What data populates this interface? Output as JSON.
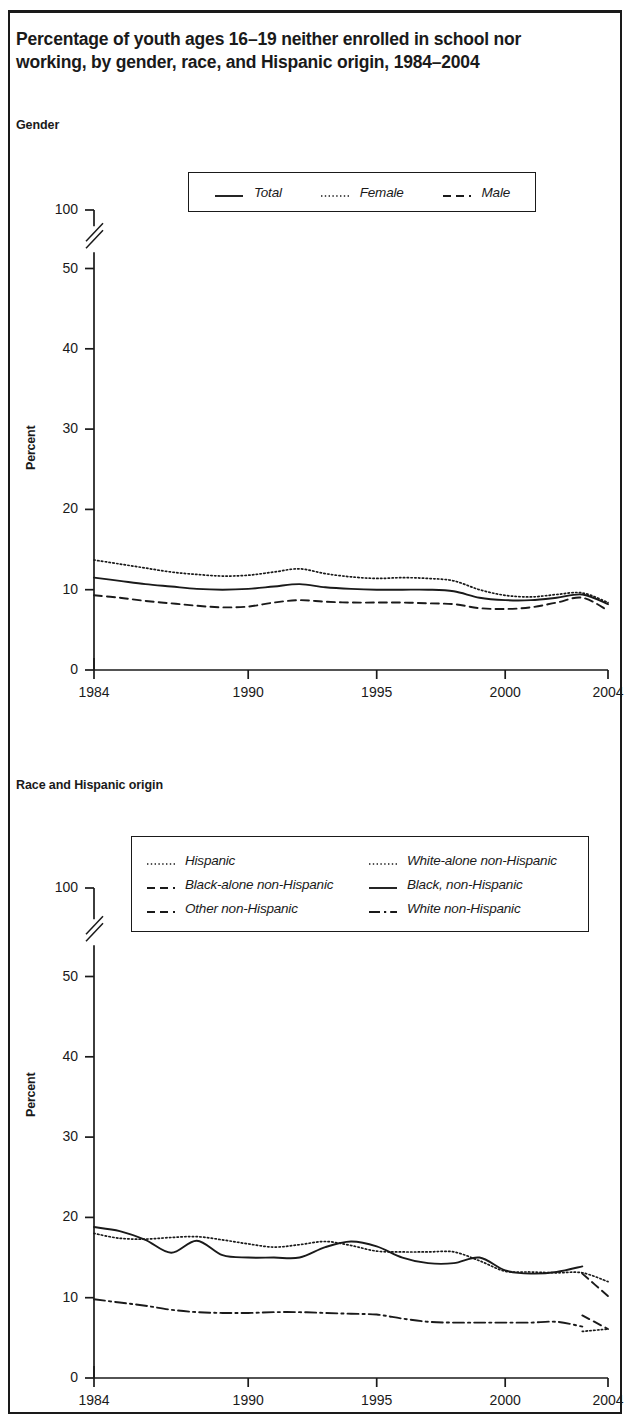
{
  "title": "Percentage of youth ages 16–19 neither enrolled in school nor working, by gender, race, and Hispanic origin, 1984–2004",
  "panels": {
    "gender": {
      "subhead": "Gender",
      "ylabel": "Percent"
    },
    "race": {
      "subhead": "Race and Hispanic origin",
      "ylabel": "Percent"
    }
  },
  "colors": {
    "ink": "#1a1a1a",
    "grid": "#1a1a1a",
    "background": "#ffffff"
  },
  "chart_data": [
    {
      "type": "line",
      "id": "gender",
      "title": "Gender",
      "xlabel": "",
      "ylabel": "Percent",
      "grid": false,
      "legend_position": "top-center",
      "axis_break": true,
      "axis_break_between": [
        50,
        100
      ],
      "xlim": [
        1984,
        2004
      ],
      "ylim": [
        0,
        100
      ],
      "ytick_labels": [
        "0",
        "10",
        "20",
        "30",
        "40",
        "50",
        "100"
      ],
      "yticks": [
        0,
        10,
        20,
        30,
        40,
        50,
        100
      ],
      "xtick_labels": [
        "1984",
        "1990",
        "1995",
        "2000",
        "2004"
      ],
      "xticks": [
        1984,
        1990,
        1995,
        2000,
        2004
      ],
      "x": [
        1984,
        1985,
        1986,
        1987,
        1988,
        1989,
        1990,
        1991,
        1992,
        1993,
        1994,
        1995,
        1996,
        1997,
        1998,
        1999,
        2000,
        2001,
        2002,
        2003,
        2004
      ],
      "series": [
        {
          "name": "Total",
          "style": "solid",
          "values": [
            11.5,
            11.1,
            10.7,
            10.4,
            10.1,
            10.0,
            10.1,
            10.4,
            10.7,
            10.3,
            10.1,
            10.0,
            10.0,
            10.0,
            9.8,
            9.0,
            8.7,
            8.7,
            9.0,
            9.4,
            8.2
          ]
        },
        {
          "name": "Female",
          "style": "dotted",
          "values": [
            13.7,
            13.2,
            12.7,
            12.2,
            11.9,
            11.7,
            11.8,
            12.2,
            12.6,
            12.0,
            11.6,
            11.4,
            11.5,
            11.4,
            11.1,
            10.0,
            9.3,
            9.1,
            9.4,
            9.6,
            8.4
          ]
        },
        {
          "name": "Male",
          "style": "dashed",
          "values": [
            9.3,
            9.0,
            8.6,
            8.3,
            8.0,
            7.8,
            7.9,
            8.4,
            8.7,
            8.5,
            8.4,
            8.4,
            8.4,
            8.3,
            8.2,
            7.7,
            7.6,
            7.8,
            8.4,
            9.0,
            7.4
          ]
        }
      ]
    },
    {
      "type": "line",
      "id": "race",
      "title": "Race and Hispanic origin",
      "xlabel": "",
      "ylabel": "Percent",
      "grid": false,
      "legend_position": "top-center",
      "axis_break": true,
      "axis_break_between": [
        50,
        100
      ],
      "xlim": [
        1984,
        2004
      ],
      "ylim": [
        0,
        100
      ],
      "ytick_labels": [
        "0",
        "10",
        "20",
        "30",
        "40",
        "50",
        "100"
      ],
      "yticks": [
        0,
        10,
        20,
        30,
        40,
        50,
        100
      ],
      "xtick_labels": [
        "1984",
        "1990",
        "1995",
        "2000",
        "2004"
      ],
      "xticks": [
        1984,
        1990,
        1995,
        2000,
        2004
      ],
      "x": [
        1984,
        1985,
        1986,
        1987,
        1988,
        1989,
        1990,
        1991,
        1992,
        1993,
        1994,
        1995,
        1996,
        1997,
        1998,
        1999,
        2000,
        2001,
        2002,
        2003,
        2004
      ],
      "series": [
        {
          "name": "Black, non-Hispanic",
          "style": "solid",
          "x": [
            1984,
            1985,
            1986,
            1987,
            1988,
            1989,
            1990,
            1991,
            1992,
            1993,
            1994,
            1995,
            1996,
            1997,
            1998,
            1999,
            2000,
            2001,
            2002,
            2003
          ],
          "values": [
            18.8,
            18.3,
            17.2,
            15.6,
            17.1,
            15.3,
            15.0,
            15.0,
            15.0,
            16.3,
            17.0,
            16.4,
            15.0,
            14.3,
            14.3,
            15.0,
            13.4,
            13.0,
            13.2,
            13.9
          ]
        },
        {
          "name": "Hispanic",
          "style": "dotted",
          "x": [
            1984,
            1985,
            1986,
            1987,
            1988,
            1989,
            1990,
            1991,
            1992,
            1993,
            1994,
            1995,
            1996,
            1997,
            1998,
            1999,
            2000,
            2001,
            2002,
            2003,
            2004
          ],
          "values": [
            18.0,
            17.4,
            17.3,
            17.5,
            17.6,
            17.2,
            16.7,
            16.3,
            16.6,
            17.0,
            16.5,
            15.8,
            15.7,
            15.7,
            15.7,
            14.6,
            13.3,
            13.2,
            13.1,
            13.1,
            12.0
          ]
        },
        {
          "name": "White non-Hispanic",
          "style": "dashdot",
          "x": [
            1984,
            1985,
            1986,
            1987,
            1988,
            1989,
            1990,
            1991,
            1992,
            1993,
            1994,
            1995,
            1996,
            1997,
            1998,
            1999,
            2000,
            2001,
            2002,
            2003
          ],
          "values": [
            9.8,
            9.4,
            9.0,
            8.5,
            8.2,
            8.1,
            8.1,
            8.2,
            8.2,
            8.1,
            8.0,
            7.9,
            7.4,
            7.0,
            6.9,
            6.9,
            6.9,
            6.9,
            7.0,
            6.4
          ]
        },
        {
          "name": "Black-alone non-Hispanic",
          "style": "dashed",
          "x": [
            2003,
            2004
          ],
          "values": [
            13.0,
            10.2
          ]
        },
        {
          "name": "White-alone non-Hispanic",
          "style": "dotted",
          "x": [
            2003,
            2004
          ],
          "values": [
            5.8,
            6.1
          ]
        },
        {
          "name": "Other non-Hispanic",
          "style": "dashed",
          "x": [
            2003,
            2004
          ],
          "values": [
            7.8,
            6.1
          ]
        }
      ]
    }
  ],
  "legends": {
    "gender": [
      {
        "label": "Total",
        "style": "solid"
      },
      {
        "label": "Female",
        "style": "dotted"
      },
      {
        "label": "Male",
        "style": "dashed"
      }
    ],
    "race": [
      {
        "label": "Hispanic",
        "style": "dotted"
      },
      {
        "label": "Black-alone non-Hispanic",
        "style": "dashed"
      },
      {
        "label": "Other non-Hispanic",
        "style": "dashed"
      },
      {
        "label": "White-alone non-Hispanic",
        "style": "dotted"
      },
      {
        "label": "Black, non-Hispanic",
        "style": "solid"
      },
      {
        "label": "White non-Hispanic",
        "style": "dashdot"
      }
    ]
  }
}
